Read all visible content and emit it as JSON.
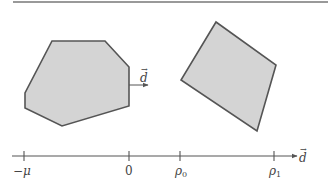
{
  "colors": {
    "stroke": "#555555",
    "fill": "#d4d4d4",
    "text": "#444444",
    "rule": "#777777"
  },
  "top_rule": {
    "x1": 13,
    "x2": 328,
    "y": 2
  },
  "shapes": {
    "left_polygon": {
      "points": [
        [
          52,
          41
        ],
        [
          105,
          41
        ],
        [
          129,
          67
        ],
        [
          129,
          106
        ],
        [
          62,
          126
        ],
        [
          25,
          108
        ],
        [
          25,
          93
        ]
      ]
    },
    "right_polygon": {
      "points": [
        [
          216,
          22
        ],
        [
          276,
          65
        ],
        [
          257,
          131
        ],
        [
          181,
          80
        ]
      ]
    }
  },
  "direction_arrow": {
    "x1": 129,
    "x2": 148,
    "y": 85,
    "label": "d",
    "label_vector": "→"
  },
  "axis": {
    "y": 156,
    "x_start": 12,
    "x_end": 291,
    "arrow_label": "d",
    "arrow_label_vector": "→",
    "ticks": [
      {
        "x": 24,
        "label": "−μ"
      },
      {
        "x": 129,
        "label": "0"
      },
      {
        "x": 180,
        "label": "ρ",
        "sub": "0"
      },
      {
        "x": 274,
        "label": "ρ",
        "sub": "1"
      }
    ]
  }
}
